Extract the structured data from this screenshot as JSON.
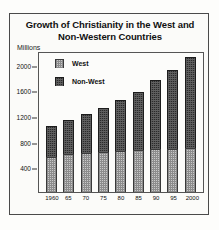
{
  "chart_data": {
    "type": "bar",
    "stacked": true,
    "title": "Growth of Christianity in the West and Non-Western Countries",
    "title_line1": "Growth of Christianity in the West and",
    "title_line2": "Non-Western Countries",
    "xlabel": "",
    "ylabel": "Millions",
    "categories": [
      "1960",
      "65",
      "70",
      "75",
      "80",
      "85",
      "90",
      "95",
      "2000"
    ],
    "series": [
      {
        "name": "West",
        "values": [
          550,
          590,
          605,
          620,
          645,
          660,
          670,
          675,
          680
        ]
      },
      {
        "name": "Non-West",
        "values": [
          480,
          530,
          615,
          690,
          795,
          900,
          1080,
          1235,
          1420
        ]
      }
    ],
    "totals": [
      1030,
      1120,
      1220,
      1310,
      1440,
      1560,
      1750,
      1910,
      2100
    ],
    "ylim": [
      0,
      2200
    ],
    "yticks": [
      400,
      800,
      1200,
      1600,
      2000
    ],
    "grid": false,
    "legend_position": "top-left",
    "legend": [
      "West",
      "Non-West"
    ],
    "colors": {
      "west": "#c9c9c9",
      "non_west": "#2b2b2b",
      "frame": "#4a4a4a",
      "text": "#111111"
    }
  }
}
